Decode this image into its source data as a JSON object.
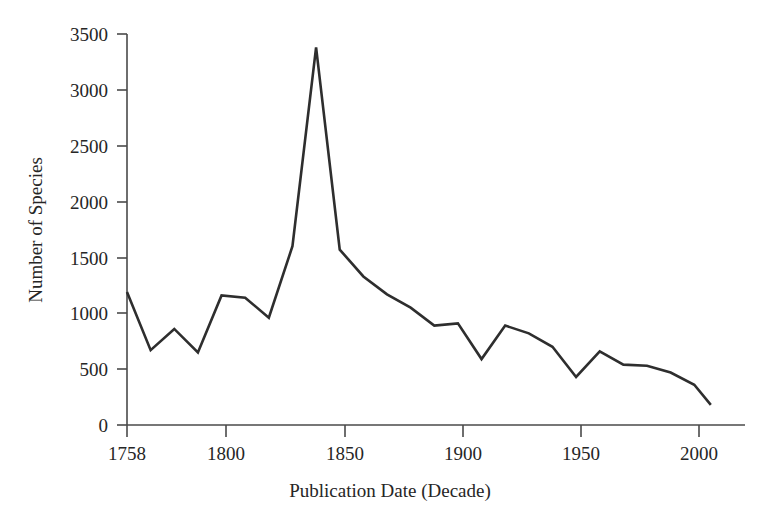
{
  "chart_data": {
    "type": "line",
    "title": "",
    "subtitle": "",
    "xlabel": "Publication Date (Decade)",
    "ylabel": "Number of Species",
    "xlim": [
      1753,
      2010
    ],
    "ylim": [
      0,
      3500
    ],
    "grid": false,
    "legend": null,
    "legend_position": "none",
    "xticks": [
      1758,
      1800,
      1850,
      1900,
      1950,
      2000
    ],
    "xticklabels": [
      "1758",
      "1800",
      "1850",
      "1900",
      "1950",
      "2000"
    ],
    "yticks": [
      0,
      500,
      1000,
      1500,
      2000,
      2500,
      3000,
      3500
    ],
    "yticklabels": [
      "0",
      "500",
      "1000",
      "1500",
      "2000",
      "2500",
      "3000",
      "3500"
    ],
    "series": [
      {
        "name": "Number of Species",
        "color": "#2e2e2e",
        "x": [
          1758,
          1768,
          1778,
          1788,
          1798,
          1808,
          1818,
          1828,
          1838,
          1848,
          1858,
          1868,
          1878,
          1888,
          1898,
          1908,
          1918,
          1928,
          1938,
          1948,
          1958,
          1968,
          1978,
          1988,
          1998,
          2005
        ],
        "values": [
          1190,
          670,
          860,
          650,
          1160,
          1140,
          960,
          1600,
          3380,
          1570,
          1330,
          1170,
          1050,
          890,
          910,
          590,
          890,
          820,
          700,
          430,
          660,
          540,
          530,
          470,
          360,
          180
        ]
      }
    ]
  },
  "axes": {
    "y_axis_label": "Number of Species",
    "x_axis_label": "Publication Date (Decade)"
  }
}
